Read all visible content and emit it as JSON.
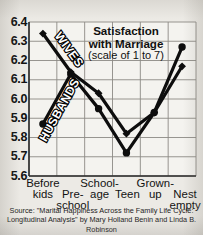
{
  "title": "Satisfaction\nwith Marriage",
  "title_line1": "Satisfaction",
  "title_line2": "with Marriage",
  "subtitle": "(scale of 1 to 7)",
  "source": "Source: \"Marital Happiness Across the Family Life Cycle: Longitudinal Analysis\" by Mary Holland Benin and Linda B. Robinson",
  "colors": {
    "background": "#eceae5",
    "plot_background": "#f4f3ef",
    "line": "#0d0d0d",
    "grid": "#8c8a85",
    "text": "#101010"
  },
  "chart_data": {
    "type": "line",
    "title": "Satisfaction with Marriage",
    "subtitle": "(scale of 1 to 7)",
    "xlabel": "",
    "ylabel": "",
    "ylim": [
      5.6,
      6.4
    ],
    "grid": true,
    "legend": "inline-series-labels",
    "categories": [
      "Before kids",
      "Pre-school",
      "School-age",
      "Teen",
      "Grown-up",
      "Nest empty"
    ],
    "ytick_labels": [
      "6.4",
      "6.3",
      "6.2",
      "6.1",
      "6.0",
      "5.9",
      "5.8",
      "5.7",
      "5.6"
    ],
    "ytick_values": [
      6.4,
      6.3,
      6.2,
      6.1,
      6.0,
      5.9,
      5.8,
      5.7,
      5.6
    ],
    "series": [
      {
        "name": "WIVES",
        "marker": "diamond",
        "values": [
          6.34,
          6.14,
          6.03,
          5.82,
          5.93,
          6.17
        ]
      },
      {
        "name": "HUSBANDS",
        "marker": "circle",
        "values": [
          5.87,
          6.13,
          5.95,
          5.72,
          5.93,
          6.27
        ]
      }
    ]
  }
}
